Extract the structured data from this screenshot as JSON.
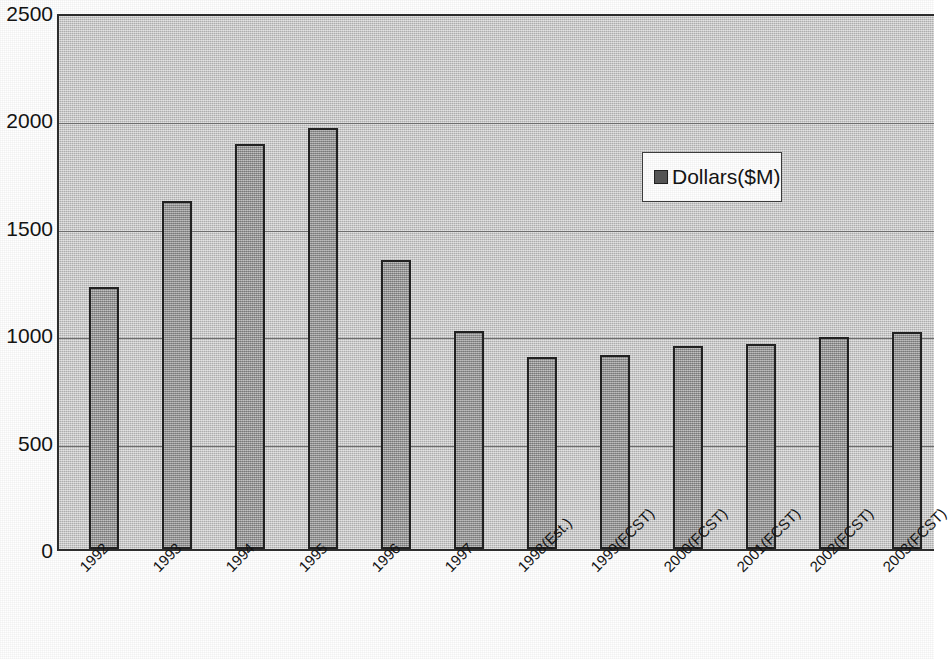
{
  "chart_data": {
    "type": "bar",
    "title": "",
    "subtitle": "",
    "xlabel": "",
    "ylabel": "",
    "categories": [
      "1992",
      "1993",
      "1994",
      "1995",
      "1996",
      "1997",
      "1998(Est.)",
      "1999(FCST)",
      "2000(FCST)",
      "2001(FCST)",
      "2002(FCST)",
      "2003(FCST)"
    ],
    "series": [
      {
        "name": "Dollars($M)",
        "values": [
          1220,
          1620,
          1885,
          1960,
          1345,
          1015,
          895,
          905,
          945,
          955,
          985,
          1010
        ]
      }
    ],
    "values": [
      1220,
      1620,
      1885,
      1960,
      1345,
      1015,
      895,
      905,
      945,
      955,
      985,
      1010
    ],
    "ylim": [
      0,
      2500
    ],
    "yticks": [
      0,
      500,
      1000,
      1500,
      2000,
      2500
    ],
    "ytick_labels": [
      "0",
      "500",
      "1000",
      "1500",
      "2000",
      "2500"
    ],
    "grid": true,
    "legend_position": "inside-upper-right",
    "colors": {
      "bar_fill": "#a0a0a0",
      "bar_border": "#1f1f1f",
      "plot_background": "#c9c9c9",
      "gridline": "#6e6e6e",
      "legend_swatch": "#555555",
      "text": "#111111"
    }
  },
  "legend": {
    "entries": [
      {
        "label": "Dollars($M)",
        "swatch_name": "legend-swatch-dollars"
      }
    ]
  },
  "axes": {
    "y": {
      "ticks": [
        "2500",
        "2000",
        "1500",
        "1000",
        "500",
        "0"
      ]
    },
    "x": {
      "ticks": [
        "1992",
        "1993",
        "1994",
        "1995",
        "1996",
        "1997",
        "1998(Est.)",
        "1999(FCST)",
        "2000(FCST)",
        "2001(FCST)",
        "2002(FCST)",
        "2003(FCST)"
      ]
    }
  }
}
